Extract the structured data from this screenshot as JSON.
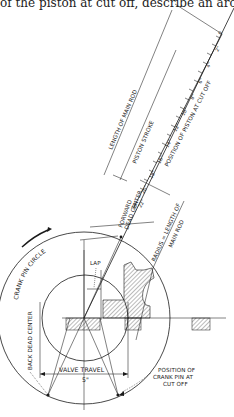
{
  "header": {
    "text_fragment": "of the piston at cut off, describe an arc"
  },
  "diagram": {
    "labels": {
      "length_of_main_rod": "LENGTH OF MAIN ROD",
      "piston_stroke": "PISTON STROKE",
      "position_of_piston_at_cut_off": "POSITION OF PISTON AT CUT OFF",
      "forward_dead_center_1": "FORWARD",
      "forward_dead_center_2": "DEAD CENTER",
      "radius_length_1": "RADIUS = LENGTH OF",
      "radius_length_2": "MAIN ROD",
      "crank_pin_circle": "CRANK PIN CIRCLE",
      "lap": "LAP",
      "back_dead_center": "BACK DEAD CENTER",
      "valve_travel": "VALVE TRAVEL",
      "valve_travel_value": "5\"",
      "crank_pin_cut_off_1": "POSITION OF",
      "crank_pin_cut_off_2": "CRANK PIN AT",
      "crank_pin_cut_off_3": "CUT OFF"
    },
    "scale_ticks": [
      "0",
      "2\"",
      "4\"",
      "6\"",
      "8\"",
      "10\"",
      "12\"",
      "14\"",
      "16\"",
      "18\"",
      "20\"",
      "22\"",
      "24\""
    ],
    "crank_pin_circle": {
      "cx": 84,
      "cy": 318,
      "r": 86
    },
    "inner_circle": {
      "cx": 85,
      "cy": 318,
      "r": 43
    }
  }
}
